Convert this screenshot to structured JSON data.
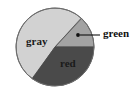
{
  "figure": {
    "background_color": "#ffffff",
    "width": 134,
    "height": 89
  },
  "chart_data": {
    "type": "pie",
    "title": "",
    "categories": [
      "gray",
      "red",
      "green"
    ],
    "values": [
      52,
      35,
      13
    ],
    "labels": [
      "gray",
      "red",
      "green"
    ],
    "colors": [
      "#d2d2d2",
      "#4a4a4a",
      "#a3a3a3"
    ],
    "legend": "none",
    "label_placement": [
      "inside",
      "inside",
      "callout"
    ],
    "start_angle_deg": 0,
    "direction": "clockwise",
    "center": [
      55,
      47
    ],
    "radius": 39,
    "outline_color": "#6e6e6e",
    "grid": false,
    "annotations": [
      {
        "text": "green",
        "type": "callout",
        "target_slice": "green",
        "dot": [
          78,
          35
        ],
        "text_position": [
          103,
          34
        ]
      }
    ]
  },
  "slices": {
    "gray": {
      "label": "gray",
      "color": "#d2d2d2",
      "label_position": [
        26,
        42
      ]
    },
    "red": {
      "label": "red",
      "color": "#4a4a4a",
      "label_position": [
        60,
        64
      ]
    },
    "green": {
      "label": "green",
      "color": "#a3a3a3",
      "label_position": [
        103,
        34
      ]
    }
  }
}
